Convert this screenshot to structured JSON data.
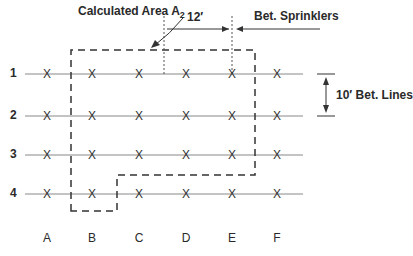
{
  "labels": {
    "area": "Calculated Area A",
    "area_sub": "2",
    "spacing_sprinklers_value": "12′",
    "spacing_sprinklers_label": "Bet. Sprinklers",
    "spacing_lines": "10′ Bet. Lines"
  },
  "rows": [
    {
      "label": "1",
      "y": 74
    },
    {
      "label": "2",
      "y": 116
    },
    {
      "label": "3",
      "y": 155
    },
    {
      "label": "4",
      "y": 194
    }
  ],
  "columns": [
    {
      "label": "A",
      "x": 47
    },
    {
      "label": "B",
      "x": 92
    },
    {
      "label": "C",
      "x": 139
    },
    {
      "label": "D",
      "x": 186
    },
    {
      "label": "E",
      "x": 232
    },
    {
      "label": "F",
      "x": 277
    }
  ],
  "sprinkler_mark": "X",
  "colors": {
    "line": "#888888",
    "dash": "#333333",
    "text": "#2a2a2a"
  }
}
